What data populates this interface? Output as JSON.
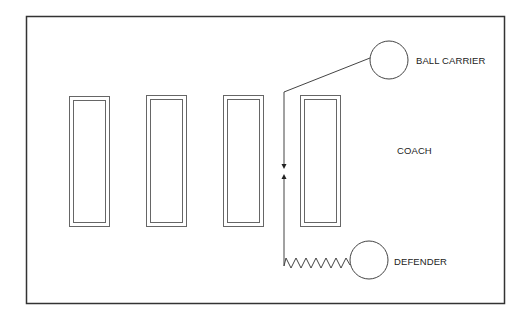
{
  "diagram": {
    "type": "drill-diagram",
    "labels": {
      "ball_carrier": "BALL CARRIER",
      "coach": "COACH",
      "defender": "DEFENDER"
    },
    "field": {
      "x": 26,
      "y": 16,
      "width": 478,
      "height": 287
    },
    "dummies": [
      {
        "id": 1,
        "x": 69,
        "y": 96,
        "width": 41,
        "height": 130
      },
      {
        "id": 2,
        "x": 146,
        "y": 95,
        "width": 41,
        "height": 131
      },
      {
        "id": 3,
        "x": 223,
        "y": 95,
        "width": 40,
        "height": 131
      },
      {
        "id": 4,
        "x": 300,
        "y": 95,
        "width": 41,
        "height": 131
      }
    ],
    "players": [
      {
        "role": "ball_carrier",
        "cx": 389,
        "cy": 60,
        "r": 19
      },
      {
        "role": "defender",
        "cx": 369,
        "cy": 260,
        "r": 19
      }
    ],
    "colors": {
      "line": "#333333",
      "dummy": "#555555",
      "background": "#ffffff"
    }
  }
}
